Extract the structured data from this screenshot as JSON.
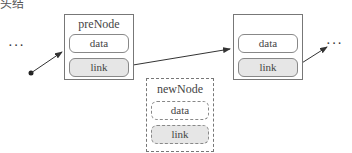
{
  "clipped_caption": "头结",
  "ellipsis_left": "···",
  "ellipsis_right": "···",
  "nodes": {
    "pre": {
      "title": "preNode",
      "data": "data",
      "link": "link"
    },
    "next": {
      "title": "",
      "data": "data",
      "link": "link"
    },
    "new": {
      "title": "newNode",
      "data": "data",
      "link": "link"
    }
  },
  "colors": {
    "link_fill": "#e6e6e6",
    "stroke": "#777777"
  }
}
